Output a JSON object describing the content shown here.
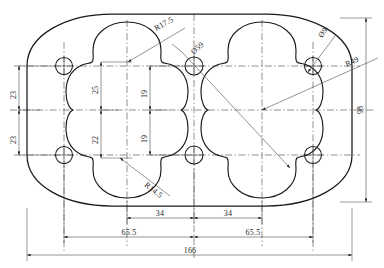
{
  "drawing": {
    "title": "Two-lobe gasket plate outline drawing",
    "units": "mm",
    "stroke_color": "#1a1a1a",
    "dimension_color": "#3a3a3a",
    "background_color": "#ffffff"
  },
  "dimensions": {
    "left_upper_23": "23",
    "left_lower_23": "23",
    "inner_upper_25": "25",
    "inner_lower_22": "22",
    "mid_upper_19": "19",
    "mid_lower_19": "19",
    "right_98": "98",
    "bottom_left_34": "34",
    "bottom_right_34": "34",
    "bottom_left_655": "65.5",
    "bottom_right_655": "65.5",
    "bottom_overall_166": "166"
  },
  "callouts": {
    "radius_17_5": "R17.5",
    "radius_14_5": "R14.5",
    "radius_49": "R49",
    "diameter_59": "Ø59",
    "diameter_9": "Ø9"
  },
  "features": {
    "corner_hole_count": 4,
    "center_hole_count": 2,
    "lobe_count": 2
  }
}
